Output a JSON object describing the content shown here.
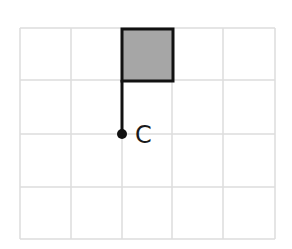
{
  "diagram": {
    "type": "grid-figure",
    "grid": {
      "columns": 5,
      "rows": 4,
      "x_lines": [
        20,
        71,
        122,
        172,
        223,
        275
      ],
      "y_lines": [
        28,
        80,
        134,
        187,
        239
      ],
      "line_color": "#dcdcdc"
    },
    "shaded_square": {
      "x": 122,
      "y": 29,
      "width": 51,
      "height": 52,
      "fill": "#a6a6a6",
      "stroke": "#111111"
    },
    "pole": {
      "x": 122,
      "y1": 80,
      "y2": 134,
      "stroke": "#111111"
    },
    "point": {
      "cx": 122,
      "cy": 134,
      "r": 5,
      "fill": "#111111"
    },
    "point_label": "C"
  }
}
